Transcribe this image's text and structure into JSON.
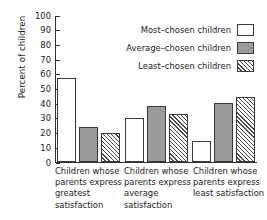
{
  "chart_data": {
    "type": "bar",
    "title": "",
    "xlabel": "",
    "ylabel": "Percent of children",
    "ylim": [
      0,
      100
    ],
    "yticks": [
      0,
      10,
      20,
      30,
      40,
      50,
      60,
      70,
      80,
      90,
      100
    ],
    "grid": false,
    "legend_position": "upper-right-inside",
    "categories": [
      "Children whose parents express greatest satisfaction",
      "Children whose parents express average satisfaction",
      "Children whose parents express least satisfaction"
    ],
    "series": [
      {
        "name": "Most-chosen children",
        "style": "white",
        "values": [
          57,
          30,
          14
        ]
      },
      {
        "name": "Average-chosen children",
        "style": "gray",
        "values": [
          24,
          38,
          40
        ]
      },
      {
        "name": "Least-chosen children",
        "style": "hatch",
        "values": [
          20,
          33,
          44
        ]
      }
    ]
  },
  "axis": {
    "y_title": "Percent of children",
    "y_tick_labels": [
      "100",
      "90",
      "80",
      "70",
      "60",
      "50",
      "40",
      "30",
      "20",
      "10",
      "0"
    ]
  },
  "legend": {
    "items": [
      {
        "label": "Most–chosen children",
        "style": "white"
      },
      {
        "label": "Average–chosen children",
        "style": "gray"
      },
      {
        "label": "Least–chosen children",
        "style": "hatch"
      }
    ]
  },
  "x_categories": [
    {
      "lines": [
        "Children whose",
        "parents express",
        "greatest",
        "satisfaction"
      ]
    },
    {
      "lines": [
        "Children whose",
        "parents express",
        "average",
        "satisfaction"
      ]
    },
    {
      "lines": [
        "Children whose",
        "parents express",
        "least satisfaction"
      ]
    }
  ]
}
